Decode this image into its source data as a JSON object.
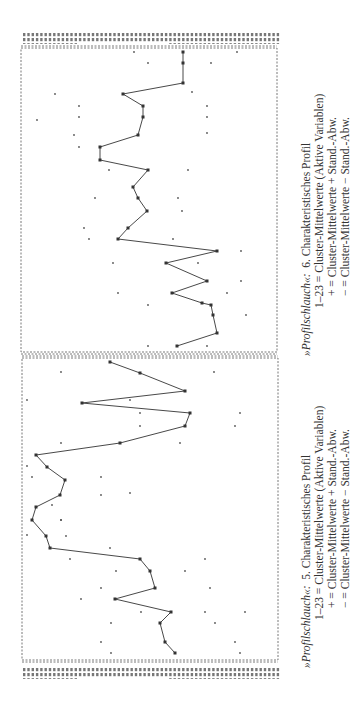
{
  "chart_data": [
    {
      "type": "line",
      "title": "»Profilschlauch«: 6. Charakteristisches Profil",
      "orientation": "rotated-90",
      "xlabel": "Variable 1–23",
      "ylabel": "Cluster-Mittelwert",
      "legend": [
        "1–23 = Cluster-Mittelwerte (Aktive Variablen)",
        "+ = Cluster-Mittelwerte + Stand.-Abw.",
        "− = Cluster-Mittelwerte − Stand.-Abw."
      ],
      "series": [
        {
          "name": "Cluster-Mittelwerte",
          "points_px": [
            [
              177,
              346
            ],
            [
              217,
              333
            ],
            [
              213,
              315
            ],
            [
              211,
              305
            ],
            [
              202,
              303
            ],
            [
              172,
              293
            ],
            [
              207,
              281
            ],
            [
              166,
              263
            ],
            [
              217,
              251
            ],
            [
              118,
              239
            ],
            [
              128,
              228
            ],
            [
              147,
              211
            ],
            [
              138,
              198
            ],
            [
              133,
              187
            ],
            [
              148,
              170
            ],
            [
              100,
              160
            ],
            [
              100,
              147
            ],
            [
              138,
              135
            ],
            [
              143,
              117
            ],
            [
              143,
              106
            ],
            [
              123,
              94
            ],
            [
              183,
              83
            ],
            [
              183,
              63
            ],
            [
              183,
              52
            ]
          ]
        },
        {
          "name": "+ Stand.-Abw.",
          "points_px": [
            [
              148,
              346
            ],
            [
              148,
              305
            ],
            [
              118,
              293
            ],
            [
              113,
              263
            ],
            [
              89,
              239
            ],
            [
              84,
              228
            ],
            [
              95,
              198
            ],
            [
              109,
              170
            ],
            [
              79,
              147
            ],
            [
              74,
              135
            ],
            [
              79,
              117
            ],
            [
              79,
              106
            ],
            [
              55,
              94
            ],
            [
              148,
              63
            ],
            [
              134,
              52
            ],
            [
              37,
              120
            ]
          ]
        },
        {
          "name": "− Stand.-Abw.",
          "points_px": [
            [
              207,
              346
            ],
            [
              246,
              315
            ],
            [
              241,
              281
            ],
            [
              227,
              293
            ],
            [
              241,
              251
            ],
            [
              198,
              263
            ],
            [
              173,
              239
            ],
            [
              182,
              211
            ],
            [
              178,
              198
            ],
            [
              188,
              170
            ],
            [
              207,
              133
            ],
            [
              207,
              117
            ],
            [
              207,
              106
            ],
            [
              192,
              92
            ],
            [
              211,
              63
            ],
            [
              237,
              52
            ]
          ]
        }
      ]
    },
    {
      "type": "line",
      "title": "»Profilschlauch«: 5. Charakteristisches Profil",
      "orientation": "rotated-90",
      "xlabel": "Variable 1–23",
      "ylabel": "Cluster-Mittelwert",
      "legend": [
        "1–23 = Cluster-Mittelwerte (Aktive Variablen)",
        "+ = Cluster-Mittelwerte + Stand.-Abw.",
        "− = Cluster-Mittelwerte − Stand.-Abw."
      ],
      "series": [
        {
          "name": "Cluster-Mittelwerte",
          "points_px": [
            [
              175,
              653
            ],
            [
              165,
              642
            ],
            [
              160,
              623
            ],
            [
              171,
              612
            ],
            [
              115,
              599
            ],
            [
              155,
              588
            ],
            [
              150,
              571
            ],
            [
              140,
              559
            ],
            [
              50,
              548
            ],
            [
              46,
              536
            ],
            [
              32,
              520
            ],
            [
              36,
              507
            ],
            [
              60,
              495
            ],
            [
              65,
              480
            ],
            [
              47,
              467
            ],
            [
              36,
              455
            ],
            [
              120,
              443
            ],
            [
              185,
              426
            ],
            [
              190,
              413
            ],
            [
              82,
              403
            ],
            [
              185,
              391
            ],
            [
              140,
              373
            ],
            [
              110,
              362
            ]
          ]
        },
        {
          "name": "+ Stand.-Abw.",
          "points_px": [
            [
              111,
              653
            ],
            [
              101,
              642
            ],
            [
              111,
              623
            ],
            [
              141,
              612
            ],
            [
              81,
              599
            ],
            [
              101,
              588
            ],
            [
              116,
              571
            ],
            [
              70,
              559
            ],
            [
              27,
              535
            ],
            [
              61,
              520
            ],
            [
              52,
              505
            ],
            [
              27,
              466
            ],
            [
              32,
              477
            ],
            [
              27,
              400
            ],
            [
              61,
              443
            ],
            [
              140,
              426
            ],
            [
              140,
              413
            ],
            [
              130,
              400
            ],
            [
              61,
              372
            ]
          ]
        },
        {
          "name": "− Stand.-Abw.",
          "points_px": [
            [
              240,
              653
            ],
            [
              235,
              642
            ],
            [
              215,
              623
            ],
            [
              205,
              612
            ],
            [
              245,
              612
            ],
            [
              210,
              588
            ],
            [
              185,
              571
            ],
            [
              205,
              559
            ],
            [
              110,
              548
            ],
            [
              66,
              536
            ],
            [
              61,
              520
            ],
            [
              101,
              495
            ],
            [
              130,
              493
            ],
            [
              101,
              477
            ],
            [
              180,
              443
            ],
            [
              240,
              413
            ],
            [
              235,
              426
            ],
            [
              214,
              372
            ]
          ]
        }
      ]
    }
  ],
  "captions": {
    "top": {
      "lead": "»Profilschlauch«:",
      "title": "6. Charakteristisches Profil",
      "line1": "1–23 = Cluster-Mittelwerte (Aktive Variablen)",
      "line2": "+ = Cluster-Mittelwerte + Stand.-Abw.",
      "line3": "− = Cluster-Mittelwerte − Stand.-Abw."
    },
    "bottom": {
      "lead": "»Profilschlauch«:",
      "title": "5. Charakteristisches Profil",
      "line1": "1–23 = Cluster-Mittelwerte (Aktive Variablen)",
      "line2": "+ = Cluster-Mittelwerte + Stand.-Abw.",
      "line3": "− = Cluster-Mittelwerte − Stand.-Abw."
    }
  }
}
